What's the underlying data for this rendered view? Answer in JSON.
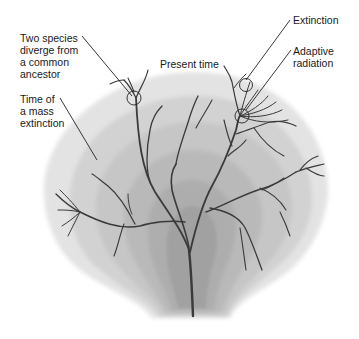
{
  "diagram": {
    "labels": {
      "diverge": "Two species\ndiverge from\na common\nancestor",
      "mass_extinction": "Time of\na mass\nextinction",
      "present_time": "Present time",
      "extinction": "Extinction",
      "adaptive_radiation": "Adaptive\nradiation"
    },
    "colors": {
      "band_outer": "#d9d9d9",
      "band_inner": "#a8a8a8",
      "branch": "#3a3a3a",
      "text": "#1a1a1a",
      "background": "#ffffff"
    }
  }
}
